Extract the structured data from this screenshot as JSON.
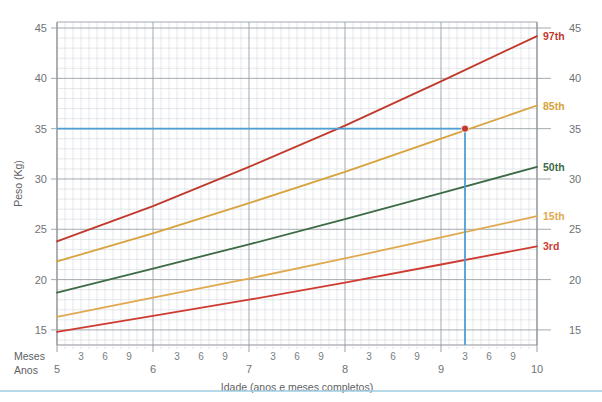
{
  "chart_data": {
    "type": "line",
    "title": "",
    "xlabel": "Idade (anos e meses completos)",
    "ylabel": "Peso (Kg)",
    "xlim": [
      5,
      10
    ],
    "ylim": [
      13.5,
      45.6
    ],
    "grid": true,
    "legend_position": "right-inline",
    "x_unit_major": "Anos",
    "x_unit_minor": "Meses",
    "y_ticks": [
      15,
      20,
      25,
      30,
      35,
      40,
      45
    ],
    "y_tick_labels": [
      "15",
      "20",
      "25",
      "30",
      "35",
      "40",
      "45"
    ],
    "y_ticks_right": [
      15,
      20,
      25,
      30,
      35,
      40,
      45
    ],
    "y_tick_labels_right": [
      "15",
      "20",
      "25",
      "30",
      "35",
      "40",
      "45"
    ],
    "x_year_ticks": [
      5,
      6,
      7,
      8,
      9,
      10
    ],
    "x_year_tick_labels": [
      "5",
      "6",
      "7",
      "8",
      "9",
      "10"
    ],
    "x_month_tick_labels": [
      "3",
      "6",
      "9"
    ],
    "x_month_ticks_per_year": [
      3,
      6,
      9
    ],
    "series": [
      {
        "name": "97th",
        "label": "97th",
        "color": "#c0392b",
        "x": [
          5,
          6,
          7,
          8,
          9,
          10
        ],
        "values": [
          23.8,
          27.3,
          31.2,
          35.3,
          39.7,
          44.2
        ]
      },
      {
        "name": "85th",
        "label": "85th",
        "color": "#d8a23c",
        "x": [
          5,
          6,
          7,
          8,
          9,
          10
        ],
        "values": [
          21.8,
          24.6,
          27.6,
          30.7,
          34.0,
          37.3
        ]
      },
      {
        "name": "50th",
        "label": "50th",
        "color": "#3d6b45",
        "x": [
          5,
          6,
          7,
          8,
          9,
          10
        ],
        "values": [
          18.7,
          21.1,
          23.5,
          26.0,
          28.6,
          31.2
        ]
      },
      {
        "name": "15th",
        "label": "15th",
        "color": "#e0a94f",
        "x": [
          5,
          6,
          7,
          8,
          9,
          10
        ],
        "values": [
          16.3,
          18.2,
          20.1,
          22.1,
          24.2,
          26.3
        ]
      },
      {
        "name": "3rd",
        "label": "3rd",
        "color": "#cf3b30",
        "x": [
          5,
          6,
          7,
          8,
          9,
          10
        ],
        "values": [
          14.8,
          16.4,
          18.0,
          19.7,
          21.5,
          23.3
        ]
      }
    ],
    "marker": {
      "name": "plotted-measurement",
      "x": 9.25,
      "y": 35.0,
      "x_label": "9 anos 3 meses",
      "y_label": "35 Kg",
      "color": "#c0392b"
    },
    "guides": {
      "color": "#4f9fd4",
      "horizontal_value": 35.0,
      "vertical_value": 9.25
    },
    "colors": {
      "grid_minor": "#d9dde2",
      "grid_major": "#9aa0a6",
      "axis": "#8d9297",
      "background": "#ffffff",
      "footer_rule": "#9ecbe0"
    }
  }
}
